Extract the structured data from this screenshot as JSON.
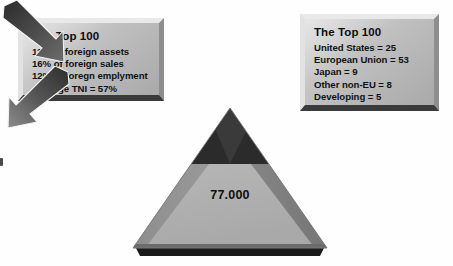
{
  "diagram": {
    "title_text": "The Top 100",
    "left_panel": {
      "title": "The Top 100",
      "lines": [
        "11% of foreign assets",
        "16% of foreign sales",
        "12% of foregn emplyment",
        "Average TNI = 57%"
      ]
    },
    "right_panel": {
      "title": "The Top 100",
      "lines": [
        "United States = 25",
        "European Union = 53",
        "Japan = 9",
        "Other non-EU = 8",
        "Developing = 5"
      ]
    },
    "pyramid": {
      "label": "77.000",
      "tip_color": "#2f2f2f",
      "body_color": "#b4b4b4",
      "edge_color": "#7d7d7d",
      "base_shadow_color": "#1c1c1c"
    },
    "arrows": [
      {
        "name": "arrow-left",
        "direction": "down-right",
        "color": "#4b4b4b"
      },
      {
        "name": "arrow-right",
        "direction": "down-left",
        "color": "#5a5a5a"
      }
    ],
    "colors": {
      "background": "#ffffff",
      "box_face": "#c4c4c4",
      "box_highlight": "#e9e9e9",
      "box_shadow": "#3a3a3a",
      "text": "#101010"
    }
  }
}
